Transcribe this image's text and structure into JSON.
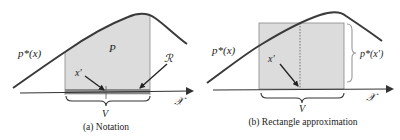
{
  "panels": [
    {
      "id": "a",
      "caption": "(a) Notation",
      "labels": {
        "density": "p*(x)",
        "mass": "P",
        "point": "x′",
        "region": "ℛ",
        "volume": "V",
        "space": "𝒳"
      }
    },
    {
      "id": "b",
      "caption": "(b) Rectangle approximation",
      "labels": {
        "density": "p*(x)",
        "point": "x′",
        "height": "p*(x′)",
        "volume": "V",
        "space": "𝒳"
      }
    }
  ],
  "colors": {
    "curve": "#3a3a3a",
    "shade": "#dcdcdc",
    "region_band": "#8a8a8a",
    "axis": "#333333"
  }
}
